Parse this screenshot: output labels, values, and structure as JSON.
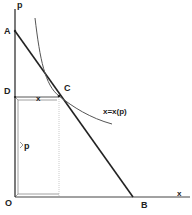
{
  "diagram": {
    "type": "economics-demand-diagram",
    "axes": {
      "y_label": "p",
      "x_label": "x",
      "origin_label": "O"
    },
    "points": {
      "A": "A",
      "B": "B",
      "C": "C",
      "D": "D"
    },
    "curve_label": "x=x(p)",
    "segment_labels": {
      "horizontal": "x",
      "vertical": "p"
    },
    "colors": {
      "line": "#222222",
      "curve": "#555555",
      "guide": "#999999",
      "background": "#ffffff"
    }
  }
}
